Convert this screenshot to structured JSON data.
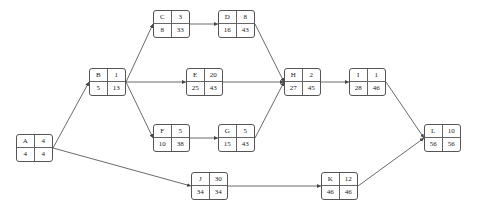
{
  "diagram": {
    "type": "activity-on-node network",
    "nodes": [
      {
        "id": "A",
        "duration": "4",
        "es": "4",
        "ef": "4",
        "x": 16,
        "y": 134
      },
      {
        "id": "B",
        "duration": "1",
        "es": "5",
        "ef": "13",
        "x": 89,
        "y": 68
      },
      {
        "id": "C",
        "duration": "3",
        "es": "8",
        "ef": "33",
        "x": 153,
        "y": 10
      },
      {
        "id": "D",
        "duration": "8",
        "es": "16",
        "ef": "43",
        "x": 218,
        "y": 10
      },
      {
        "id": "E",
        "duration": "20",
        "es": "25",
        "ef": "43",
        "x": 186,
        "y": 68
      },
      {
        "id": "F",
        "duration": "5",
        "es": "10",
        "ef": "38",
        "x": 153,
        "y": 124
      },
      {
        "id": "G",
        "duration": "5",
        "es": "15",
        "ef": "43",
        "x": 218,
        "y": 124
      },
      {
        "id": "H",
        "duration": "2",
        "es": "27",
        "ef": "45",
        "x": 284,
        "y": 68
      },
      {
        "id": "I",
        "duration": "1",
        "es": "28",
        "ef": "46",
        "x": 349,
        "y": 68
      },
      {
        "id": "J",
        "duration": "30",
        "es": "34",
        "ef": "34",
        "x": 191,
        "y": 172
      },
      {
        "id": "K",
        "duration": "12",
        "es": "46",
        "ef": "46",
        "x": 321,
        "y": 172
      },
      {
        "id": "L",
        "duration": "10",
        "es": "56",
        "ef": "56",
        "x": 424,
        "y": 124
      }
    ],
    "edges": [
      {
        "from": "A",
        "to": "B"
      },
      {
        "from": "A",
        "to": "J"
      },
      {
        "from": "B",
        "to": "C"
      },
      {
        "from": "B",
        "to": "E"
      },
      {
        "from": "B",
        "to": "F"
      },
      {
        "from": "C",
        "to": "D"
      },
      {
        "from": "D",
        "to": "H"
      },
      {
        "from": "E",
        "to": "H"
      },
      {
        "from": "F",
        "to": "G"
      },
      {
        "from": "G",
        "to": "H"
      },
      {
        "from": "H",
        "to": "I"
      },
      {
        "from": "I",
        "to": "L"
      },
      {
        "from": "J",
        "to": "K"
      },
      {
        "from": "K",
        "to": "L"
      }
    ],
    "colors": {
      "line": "#444444",
      "border": "#555555",
      "text": "#222222"
    }
  }
}
